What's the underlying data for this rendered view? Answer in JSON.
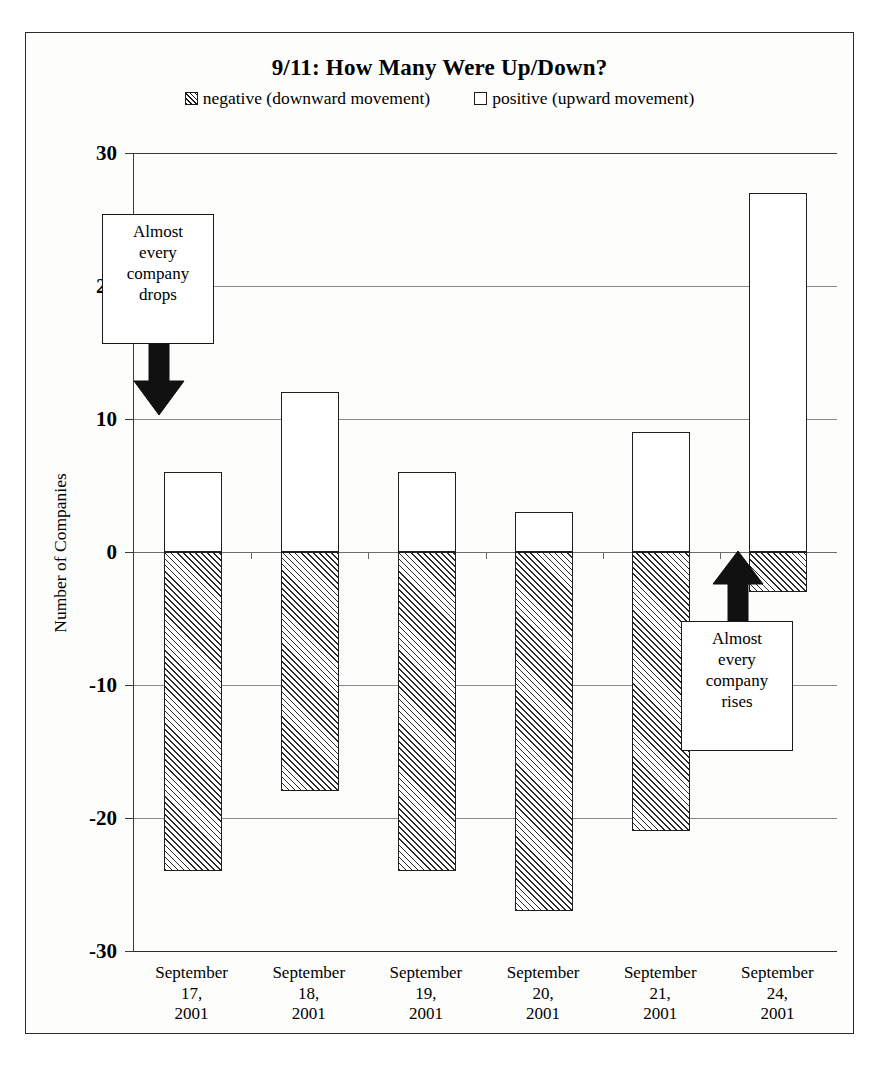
{
  "chart_data": {
    "type": "bar",
    "title": "9/11: How Many Were Up/Down?",
    "xlabel": "",
    "ylabel": "Number of Companies",
    "ylim": [
      -30,
      30
    ],
    "ytick_step": 10,
    "grid": true,
    "legend_position": "top-center",
    "stacked": true,
    "categories": [
      "September\n17,\n2001",
      "September\n18,\n2001",
      "September\n19,\n2001",
      "September\n20,\n2001",
      "September\n21,\n2001",
      "September\n24,\n2001"
    ],
    "series": [
      {
        "name": "negative (downward movement)",
        "values": [
          -24,
          -18,
          -24,
          -27,
          -21,
          -3
        ]
      },
      {
        "name": "positive (upward movement)",
        "values": [
          6,
          12,
          6,
          3,
          9,
          27
        ]
      }
    ],
    "ytick_labels": [
      "30",
      "20",
      "10",
      "0",
      "-10",
      "-20",
      "-30"
    ],
    "annotations": [
      {
        "text": "Almost\nevery\ncompany\ndrops",
        "arrow": "down",
        "target_category": "September 17, 2001"
      },
      {
        "text": "Almost\nevery\ncompany\nrises",
        "arrow": "up",
        "target_category": "September 24, 2001"
      }
    ]
  },
  "legend": {
    "negative_label": "negative (downward movement)",
    "positive_label": "positive (upward movement)"
  },
  "axis": {
    "y_title": "Number of Companies",
    "ticks": [
      "30",
      "20",
      "10",
      "0",
      "-10",
      "-20",
      "-30"
    ]
  },
  "x_categories": [
    {
      "line1": "September",
      "line2": "17,",
      "line3": "2001"
    },
    {
      "line1": "September",
      "line2": "18,",
      "line3": "2001"
    },
    {
      "line1": "September",
      "line2": "19,",
      "line3": "2001"
    },
    {
      "line1": "September",
      "line2": "20,",
      "line3": "2001"
    },
    {
      "line1": "September",
      "line2": "21,",
      "line3": "2001"
    },
    {
      "line1": "September",
      "line2": "24,",
      "line3": "2001"
    }
  ],
  "callouts": {
    "drops": {
      "l1": "Almost",
      "l2": "every",
      "l3": "company",
      "l4": "drops"
    },
    "rises": {
      "l1": "Almost",
      "l2": "every",
      "l3": "company",
      "l4": "rises"
    }
  },
  "colors": {
    "ink": "#1a1a1a",
    "grid": "#8a8a8a",
    "background": "#ffffff"
  }
}
